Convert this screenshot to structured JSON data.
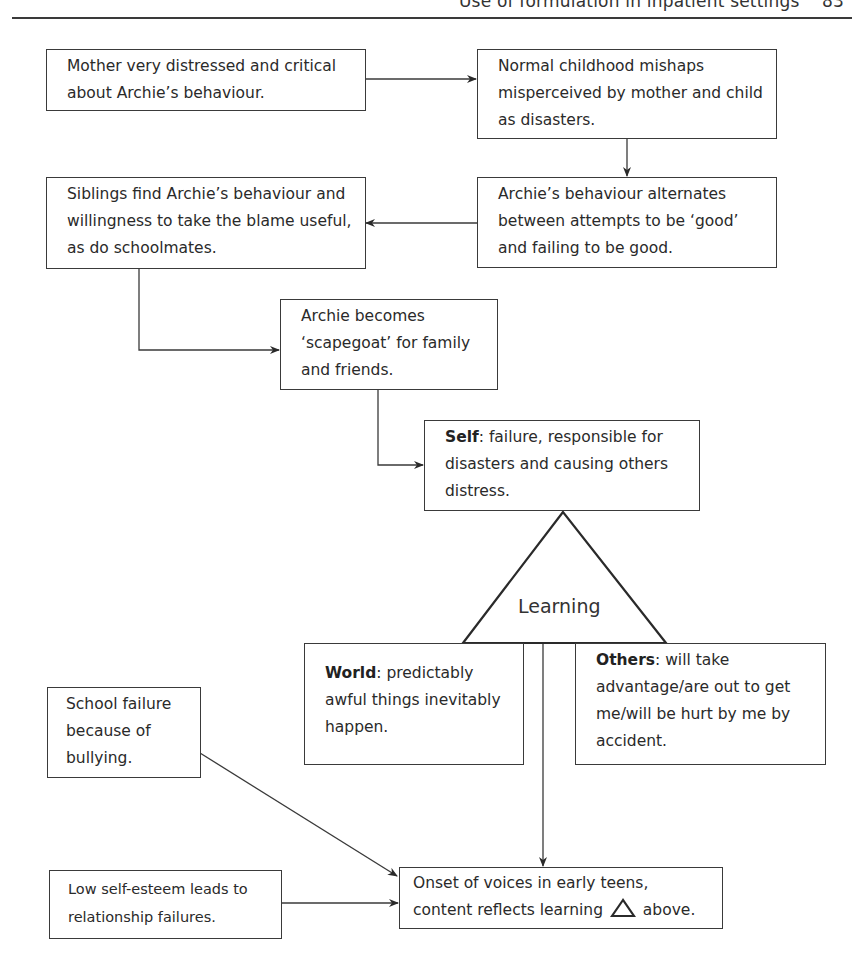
{
  "header": {
    "running_title": "Use of formulation in inpatient settings",
    "page_number": "83"
  },
  "boxes": {
    "mother": {
      "text": "Mother very distressed and critical about Archie’s behaviour."
    },
    "normal": {
      "text": "Normal childhood mishaps misperceived by mother and child as disasters."
    },
    "alternates": {
      "text": "Archie’s behaviour alternates between attempts to be ‘good’ and failing to be good."
    },
    "siblings": {
      "text": "Siblings find Archie’s behaviour and willingness to take the blame useful, as do schoolmates."
    },
    "scapegoat": {
      "text": "Archie becomes ‘scapegoat’ for family and friends."
    },
    "self": {
      "label": "Self",
      "text": ": failure, responsible for disasters and causing others distress."
    },
    "world": {
      "label": "World",
      "text": ": predictably awful things inevitably happen."
    },
    "others": {
      "label": "Others",
      "text": ": will take advantage/are out to get me/will be hurt by me by accident."
    },
    "school": {
      "text": "School failure because of bullying."
    },
    "low_esteem": {
      "text": "Low self-esteem leads to relationship failures."
    },
    "onset": {
      "text_before": "Onset of voices in early teens, content reflects learning",
      "text_after": "above."
    }
  },
  "triangle": {
    "label": "Learning"
  },
  "colors": {
    "line": "#3a3a3a",
    "text": "#2a2a2a",
    "background": "#ffffff"
  }
}
